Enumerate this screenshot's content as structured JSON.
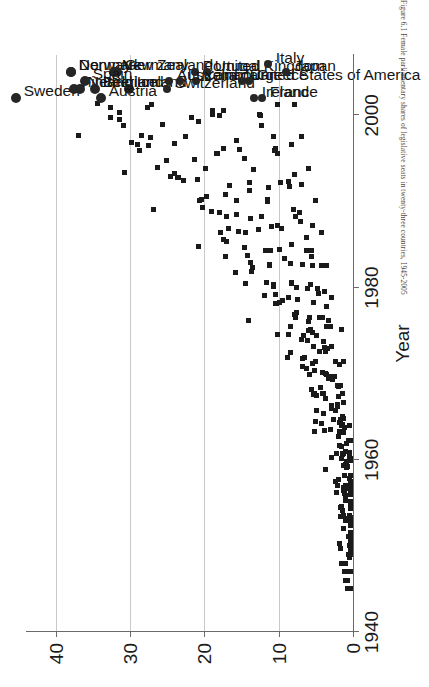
{
  "figure": {
    "caption": "Figure 6.1  Female parliamentary shares of legislative seats in twenty-three countries, 1945-2005",
    "orientation": "rotated-90-ccw"
  },
  "chart_data": {
    "type": "scatter",
    "title": "",
    "xlabel": "Year",
    "ylabel": "",
    "xlim": [
      1940,
      2007
    ],
    "ylim": [
      0,
      44
    ],
    "xticks": [
      1940,
      1960,
      1980,
      2000
    ],
    "yticks": [
      0,
      10,
      20,
      30,
      40
    ],
    "grid": "value-axis gridlines at 0, 10, 20, 30, 40",
    "legend": "none (countries labelled at terminal point)",
    "marker_small": "square",
    "marker_terminal": "filled circle",
    "note": "Each small square is one country-election observation; the large circle is the most recent (terminal) observation, annotated with the country name.",
    "countries": [
      {
        "name": "Sweden",
        "final_year": 2002,
        "final_value": 45.3
      },
      {
        "name": "Denmark",
        "final_year": 2005,
        "final_value": 38.0
      },
      {
        "name": "Finland",
        "final_year": 2003,
        "final_value": 37.5
      },
      {
        "name": "Norway",
        "final_year": 2005,
        "final_value": 37.9
      },
      {
        "name": "Netherlands",
        "final_year": 2003,
        "final_value": 36.7
      },
      {
        "name": "Iceland",
        "final_year": 2003,
        "final_value": 30.2
      },
      {
        "name": "Germany",
        "final_year": 2005,
        "final_value": 31.8
      },
      {
        "name": "New Zealand",
        "final_year": 2005,
        "final_value": 32.2
      },
      {
        "name": "Spain",
        "final_year": 2004,
        "final_value": 36.0
      },
      {
        "name": "Austria",
        "final_year": 2002,
        "final_value": 33.9
      },
      {
        "name": "Australia",
        "final_year": 2004,
        "final_value": 24.7
      },
      {
        "name": "Belgium",
        "final_year": 2003,
        "final_value": 34.7
      },
      {
        "name": "Switzerland",
        "final_year": 2003,
        "final_value": 25.0
      },
      {
        "name": "Canada",
        "final_year": 2004,
        "final_value": 21.1
      },
      {
        "name": "Portugal",
        "final_year": 2005,
        "final_value": 21.3
      },
      {
        "name": "United Kingdom",
        "final_year": 2005,
        "final_value": 19.7
      },
      {
        "name": "Luxembourg",
        "final_year": 2004,
        "final_value": 23.3
      },
      {
        "name": "United States of America",
        "final_year": 2004,
        "final_value": 15.0
      },
      {
        "name": "Ireland",
        "final_year": 2002,
        "final_value": 13.3
      },
      {
        "name": "France",
        "final_year": 2002,
        "final_value": 12.2
      },
      {
        "name": "Italy",
        "final_year": 2006,
        "final_value": 11.5
      },
      {
        "name": "Greece",
        "final_year": 2004,
        "final_value": 14.0
      },
      {
        "name": "Japan",
        "final_year": 2005,
        "final_value": 9.0
      }
    ],
    "terminal_points": [
      {
        "country": "Sweden",
        "year": 2002,
        "value": 45.3,
        "label_anchor": "left"
      },
      {
        "country": "Denmark",
        "year": 2005,
        "value": 38.0
      },
      {
        "country": "Norway",
        "year": 2005,
        "value": 37.9
      },
      {
        "country": "Netherlands",
        "year": 2003,
        "value": 36.7
      },
      {
        "country": "Finland",
        "year": 2003,
        "value": 37.5
      },
      {
        "country": "Iceland",
        "year": 2003,
        "value": 30.2
      },
      {
        "country": "Germany",
        "year": 2005,
        "value": 31.8
      },
      {
        "country": "New Zealand",
        "year": 2005,
        "value": 32.2
      },
      {
        "country": "Spain",
        "year": 2004,
        "value": 36.0
      },
      {
        "country": "Austria",
        "year": 2002,
        "value": 33.9
      },
      {
        "country": "Australia",
        "year": 2004,
        "value": 24.7
      },
      {
        "country": "Belgium",
        "year": 2003,
        "value": 34.7
      },
      {
        "country": "Switzerland",
        "year": 2003,
        "value": 25.0
      },
      {
        "country": "Canada",
        "year": 2004,
        "value": 21.1
      },
      {
        "country": "Portugal",
        "year": 2005,
        "value": 21.3
      },
      {
        "country": "United Kingdom",
        "year": 2005,
        "value": 19.7
      },
      {
        "country": "Luxembourg",
        "year": 2004,
        "value": 23.3
      },
      {
        "country": "United States of America",
        "year": 2004,
        "value": 15.0
      },
      {
        "country": "Ireland",
        "year": 2002,
        "value": 13.3
      },
      {
        "country": "France",
        "year": 2002,
        "value": 12.2
      },
      {
        "country": "Italy",
        "year": 2006,
        "value": 11.5
      },
      {
        "country": "Greece",
        "year": 2004,
        "value": 14.0
      },
      {
        "country": "Japan",
        "year": 2005,
        "value": 9.0
      }
    ]
  },
  "axes": {
    "value_axis": {
      "ticks": [
        "40",
        "30",
        "20",
        "10",
        "0"
      ],
      "tick_values": [
        40,
        30,
        20,
        10,
        0
      ]
    },
    "year_axis": {
      "title": "Year",
      "ticks": [
        "1940",
        "1960",
        "1980",
        "2000"
      ],
      "tick_values": [
        1940,
        1960,
        1980,
        2000
      ]
    }
  },
  "colors": {
    "marker": "#1a1a1a",
    "gridline": "#c9c9c9",
    "axis": "#6a6a6a",
    "text": "#141414",
    "background": "#ffffff"
  }
}
